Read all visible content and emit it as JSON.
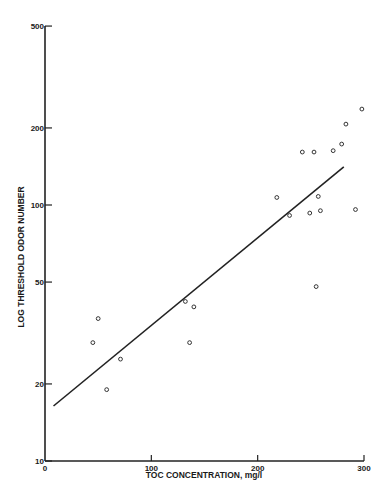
{
  "chart_data": {
    "type": "scatter",
    "title": "",
    "xlabel": "TOC CONCENTRATION, mg/l",
    "ylabel": "LOG THRESHOLD ODOR NUMBER",
    "xlim": [
      0,
      300
    ],
    "ylim": [
      10,
      500
    ],
    "yscale": "log",
    "grid": false,
    "legend": null,
    "x_ticks": [
      0,
      100,
      200,
      300
    ],
    "x_tick_labels": [
      "0",
      "100",
      "200",
      "300"
    ],
    "y_ticks": [
      10,
      20,
      50,
      100,
      200,
      500
    ],
    "y_tick_labels": [
      "10",
      "20",
      "50",
      "100",
      "200",
      "500"
    ],
    "series": [
      {
        "name": "observations",
        "marker": "open-circle",
        "points": [
          {
            "x": 45,
            "y": 29
          },
          {
            "x": 50,
            "y": 36
          },
          {
            "x": 58,
            "y": 19
          },
          {
            "x": 71,
            "y": 25
          },
          {
            "x": 132,
            "y": 42
          },
          {
            "x": 136,
            "y": 29
          },
          {
            "x": 140,
            "y": 40
          },
          {
            "x": 218,
            "y": 107
          },
          {
            "x": 230,
            "y": 91
          },
          {
            "x": 242,
            "y": 161
          },
          {
            "x": 249,
            "y": 93
          },
          {
            "x": 253,
            "y": 161
          },
          {
            "x": 255,
            "y": 48
          },
          {
            "x": 257,
            "y": 108
          },
          {
            "x": 259,
            "y": 95
          },
          {
            "x": 271,
            "y": 163
          },
          {
            "x": 279,
            "y": 173
          },
          {
            "x": 283,
            "y": 207
          },
          {
            "x": 292,
            "y": 96
          },
          {
            "x": 298,
            "y": 237
          }
        ]
      },
      {
        "name": "regression line",
        "type": "line",
        "points": [
          {
            "x": 8,
            "y": 16.4
          },
          {
            "x": 281,
            "y": 141
          }
        ]
      }
    ]
  }
}
